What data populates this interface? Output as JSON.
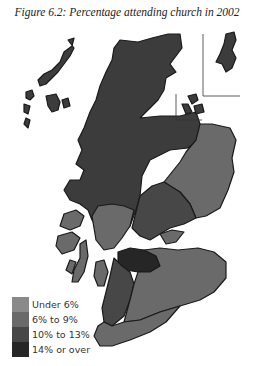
{
  "title": "Figure 6.2: Percentage attending church in 2002",
  "legend": {
    "items": [
      {
        "label": "Under 6%",
        "color": "#8a8a8a"
      },
      {
        "label": "6% to 9%",
        "color": "#6a6a6a"
      },
      {
        "label": "10% to 13%",
        "color": "#474747"
      },
      {
        "label": "14% or over",
        "color": "#262626"
      }
    ]
  },
  "colors": {
    "highlands": "#3c3c3c",
    "under6": "#8a8a8a",
    "six_to_nine": "#6a6a6a",
    "ten_to_thirteen": "#474747",
    "fourteen_plus": "#262626",
    "border": "#1a1a1a"
  }
}
